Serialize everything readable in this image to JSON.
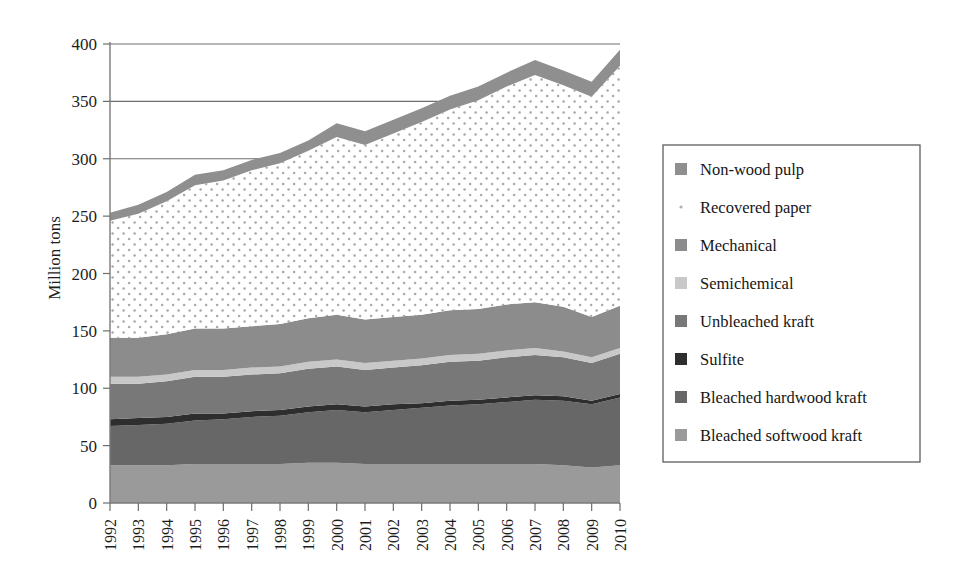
{
  "chart_data": {
    "type": "area",
    "stacked": true,
    "title": "",
    "xlabel": "",
    "ylabel": "Million tons",
    "ylim": [
      0,
      400
    ],
    "ytick_step": 50,
    "grid": true,
    "grid_values": [
      300,
      350,
      400
    ],
    "legend_position": "right",
    "yticks": [
      "0",
      "50",
      "100",
      "150",
      "200",
      "250",
      "300",
      "350",
      "400"
    ],
    "categories": [
      "1992",
      "1993",
      "1994",
      "1995",
      "1996",
      "1997",
      "1998",
      "1999",
      "2000",
      "2001",
      "2002",
      "2003",
      "2004",
      "2005",
      "2006",
      "2007",
      "2008",
      "2009",
      "2010"
    ],
    "series": [
      {
        "name": "Bleached softwood kraft",
        "color": "#9a9a9a",
        "values": [
          33,
          33,
          33,
          34,
          34,
          34,
          34,
          35,
          35,
          34,
          34,
          34,
          34,
          34,
          34,
          34,
          33,
          31,
          33
        ]
      },
      {
        "name": "Bleached hardwood kraft",
        "color": "#676767",
        "values": [
          34,
          35,
          36,
          38,
          39,
          41,
          42,
          44,
          46,
          45,
          47,
          49,
          51,
          52,
          54,
          56,
          56,
          55,
          59
        ]
      },
      {
        "name": "Sulfite",
        "color": "#2e2e2e",
        "values": [
          6,
          6,
          6,
          6,
          5,
          5,
          5,
          5,
          5,
          5,
          5,
          4,
          4,
          4,
          4,
          4,
          4,
          3,
          3
        ]
      },
      {
        "name": "Unbleached kraft",
        "color": "#787878",
        "values": [
          31,
          30,
          31,
          32,
          32,
          32,
          32,
          33,
          33,
          32,
          32,
          33,
          34,
          34,
          35,
          35,
          34,
          33,
          35
        ]
      },
      {
        "name": "Semichemical",
        "color": "#c8c8c8",
        "values": [
          6,
          6,
          6,
          6,
          6,
          6,
          6,
          6,
          6,
          6,
          6,
          6,
          6,
          6,
          6,
          6,
          5,
          5,
          5
        ]
      },
      {
        "name": "Mechanical",
        "color": "#8c8c8c",
        "values": [
          34,
          34,
          35,
          36,
          36,
          36,
          37,
          38,
          39,
          38,
          38,
          38,
          39,
          39,
          40,
          40,
          39,
          35,
          37
        ]
      },
      {
        "name": "Recovered paper",
        "color": "#ffffff",
        "pattern": "dotted",
        "values": [
          102,
          108,
          116,
          125,
          129,
          136,
          140,
          146,
          155,
          152,
          160,
          168,
          175,
          182,
          190,
          198,
          193,
          192,
          209
        ]
      },
      {
        "name": "Non-wood pulp",
        "color": "#8f8f8f",
        "values": [
          7,
          8,
          8,
          9,
          9,
          9,
          9,
          9,
          12,
          12,
          12,
          12,
          12,
          12,
          12,
          13,
          13,
          13,
          14
        ]
      }
    ],
    "totals": [
      253,
      260,
      271,
      286,
      290,
      299,
      305,
      316,
      331,
      324,
      334,
      344,
      355,
      363,
      375,
      386,
      377,
      367,
      395
    ]
  },
  "legend": {
    "items": [
      {
        "label": "Non-wood pulp",
        "swatch": "#8f8f8f",
        "style": "solid"
      },
      {
        "label": "Recovered paper",
        "swatch": "#b8b8b8",
        "style": "dot"
      },
      {
        "label": "Mechanical",
        "swatch": "#8c8c8c",
        "style": "solid"
      },
      {
        "label": "Semichemical",
        "swatch": "#c8c8c8",
        "style": "solid"
      },
      {
        "label": "Unbleached kraft",
        "swatch": "#787878",
        "style": "solid"
      },
      {
        "label": "Sulfite",
        "swatch": "#2e2e2e",
        "style": "solid"
      },
      {
        "label": "Bleached hardwood kraft",
        "swatch": "#676767",
        "style": "solid"
      },
      {
        "label": "Bleached softwood kraft",
        "swatch": "#9a9a9a",
        "style": "solid"
      }
    ]
  }
}
